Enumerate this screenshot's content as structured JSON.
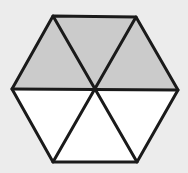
{
  "diagram": {
    "shape": "regular hexagon divided into 6 equilateral triangles",
    "total_parts": 6,
    "shaded_parts": 3,
    "fraction_shaded": "3/6",
    "colors": {
      "background": "#ececec",
      "shaded": "#cbcbcb",
      "unshaded": "#ffffff",
      "stroke": "#1a1a1a"
    },
    "vertices": {
      "center": [
        95,
        89
      ],
      "top_left": [
        53,
        16
      ],
      "top_right": [
        136,
        17
      ],
      "right": [
        178,
        90
      ],
      "bottom_right": [
        137,
        162
      ],
      "bottom_left": [
        53,
        162
      ],
      "left": [
        12,
        89
      ]
    },
    "triangles": [
      {
        "name": "top-left",
        "shaded": true
      },
      {
        "name": "top",
        "shaded": true
      },
      {
        "name": "top-right",
        "shaded": true
      },
      {
        "name": "bottom-right",
        "shaded": false
      },
      {
        "name": "bottom",
        "shaded": false
      },
      {
        "name": "bottom-left",
        "shaded": false
      }
    ]
  }
}
